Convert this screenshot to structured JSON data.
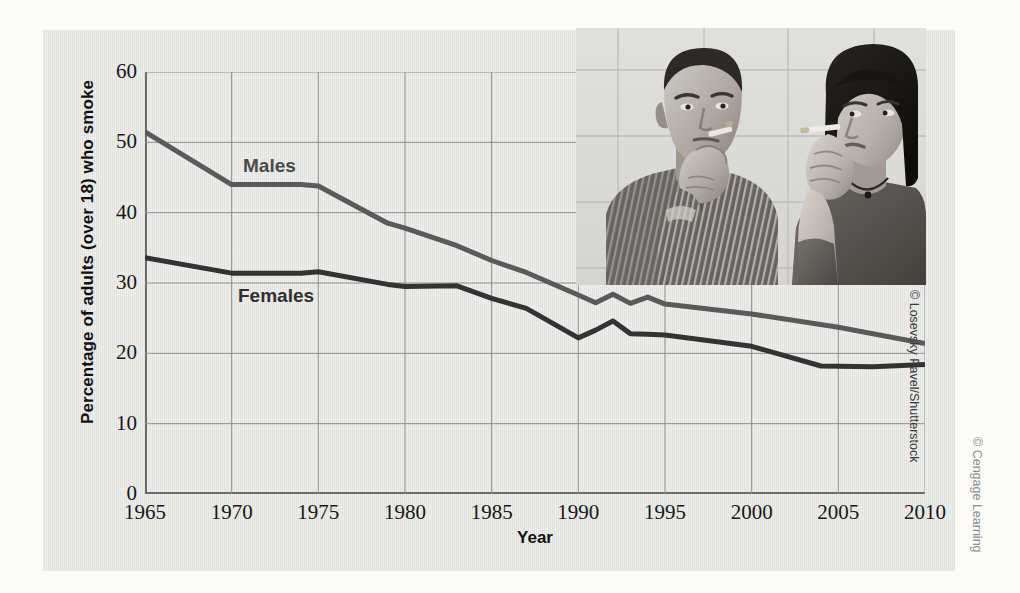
{
  "figure": {
    "panel_bg": "#e6e6e4",
    "page_bg": "#fbfbfa",
    "photo_credit": "© Losevsky Pavel/Shutterstock",
    "publisher_credit": "© Cengage Learning",
    "photo_alt": "Young man and young woman smoking cigarettes"
  },
  "chart_data": {
    "type": "line",
    "title": "",
    "xlabel": "Year",
    "ylabel": "Percentage of adults (over 18) who smoke",
    "xlim": [
      1965,
      2010
    ],
    "ylim": [
      0,
      60
    ],
    "xticks": [
      1965,
      1970,
      1975,
      1980,
      1985,
      1990,
      1995,
      2000,
      2005,
      2010
    ],
    "yticks": [
      0,
      10,
      20,
      30,
      40,
      50,
      60
    ],
    "grid": true,
    "legend_position": "inline-labels",
    "series": [
      {
        "name": "Males",
        "color": "#5a5a5a",
        "x": [
          1965,
          1970,
          1974,
          1975,
          1979,
          1980,
          1983,
          1985,
          1987,
          1990,
          1991,
          1992,
          1993,
          1994,
          1995,
          2000,
          2005,
          2010
        ],
        "values": [
          51.5,
          44.0,
          44.0,
          43.8,
          38.5,
          37.8,
          35.3,
          33.2,
          31.5,
          28.3,
          27.2,
          28.4,
          27.1,
          28.0,
          27.0,
          25.6,
          23.7,
          21.4
        ]
      },
      {
        "name": "Females",
        "color": "#333333",
        "x": [
          1965,
          1970,
          1974,
          1975,
          1979,
          1980,
          1983,
          1985,
          1987,
          1990,
          1991,
          1992,
          1993,
          1994,
          1995,
          2000,
          2004,
          2007,
          2010
        ],
        "values": [
          33.6,
          31.4,
          31.4,
          31.6,
          29.8,
          29.5,
          29.6,
          27.8,
          26.4,
          22.2,
          23.3,
          24.6,
          22.8,
          22.7,
          22.6,
          21.0,
          18.2,
          18.1,
          18.4
        ]
      }
    ],
    "annotations": [
      {
        "text": "Males",
        "x": 1972.5,
        "y": 47.0
      },
      {
        "text": "Females",
        "x": 1972.0,
        "y": 28.3
      }
    ]
  }
}
